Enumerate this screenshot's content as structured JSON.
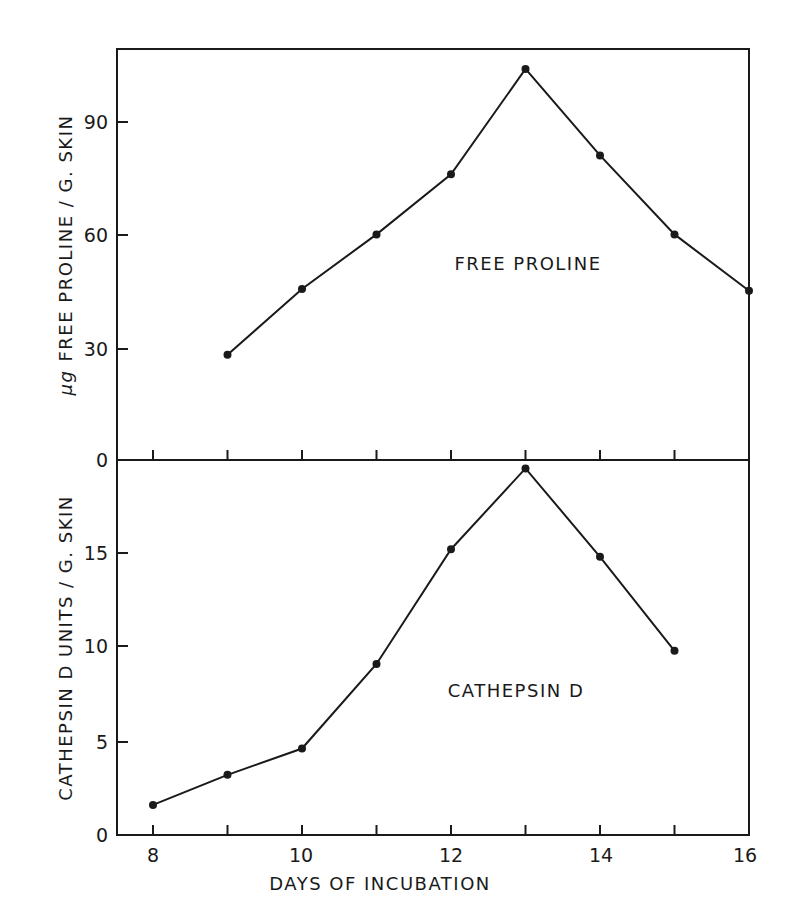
{
  "chart_data": [
    {
      "type": "line",
      "title": "",
      "annotation": "FREE PROLINE",
      "xlabel": "DAYS OF INCUBATION",
      "ylabel": "μg FREE PROLINE / G. SKIN",
      "x": [
        9,
        10,
        11,
        12,
        13,
        14,
        15,
        16
      ],
      "series": [
        {
          "name": "FREE PROLINE",
          "values": [
            28,
            45.5,
            60,
            76,
            104,
            81,
            60,
            45
          ]
        }
      ],
      "xlim": [
        7.5,
        16
      ],
      "ylim": [
        0,
        112
      ],
      "yticks": [
        0,
        30,
        60,
        90
      ],
      "ytick_labels": [
        "0",
        "30",
        "60",
        "90"
      ],
      "grid": false,
      "legend": "none"
    },
    {
      "type": "line",
      "title": "",
      "annotation": "CATHEPSIN D",
      "xlabel": "DAYS OF INCUBATION",
      "ylabel": "CATHEPSIN D UNITS / G. SKIN",
      "x": [
        8,
        9,
        10,
        11,
        12,
        13,
        14,
        15
      ],
      "series": [
        {
          "name": "CATHEPSIN D",
          "values": [
            1.6,
            3.2,
            4.6,
            9.1,
            15.2,
            19.5,
            14.8,
            9.8
          ]
        }
      ],
      "xlim": [
        7.5,
        16
      ],
      "ylim": [
        0,
        20
      ],
      "xticks": [
        8,
        9,
        10,
        11,
        12,
        13,
        14,
        15,
        16
      ],
      "xtick_labels": [
        "8",
        "10",
        "12",
        "14",
        "16"
      ],
      "yticks": [
        0,
        5,
        10,
        15
      ],
      "ytick_labels": [
        "0",
        "5",
        "10",
        "15"
      ],
      "grid": false,
      "legend": "none"
    }
  ],
  "labels": {
    "top_ylabel_prefix": "μg",
    "top_ylabel": "FREE PROLINE / G. SKIN",
    "bottom_ylabel": "CATHEPSIN D  UNITS / G. SKIN",
    "xlabel": "DAYS OF INCUBATION",
    "top_annotation": "FREE PROLINE",
    "bottom_annotation": "CATHEPSIN D",
    "top_yticks": [
      "0",
      "30",
      "60",
      "90"
    ],
    "bottom_yticks": [
      "0",
      "5",
      "10",
      "15"
    ],
    "xticks": [
      "8",
      "10",
      "12",
      "14",
      "16"
    ]
  },
  "colors": {
    "ink": "#1a1a1a",
    "background": "#ffffff"
  }
}
